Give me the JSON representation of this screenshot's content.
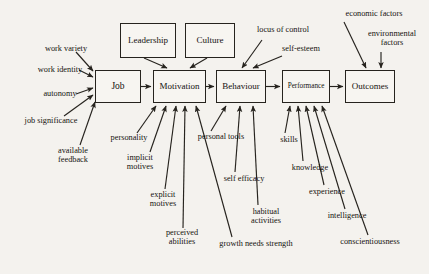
{
  "diagram": {
    "background_color": "#f4f2ee",
    "line_color": "#26231e",
    "boxes": [
      {
        "id": "leadership",
        "label": "Leadership",
        "x": 120,
        "y": 23,
        "w": 56,
        "h": 35,
        "size": 9
      },
      {
        "id": "culture",
        "label": "Culture",
        "x": 185,
        "y": 23,
        "w": 50,
        "h": 35,
        "size": 9
      },
      {
        "id": "job",
        "label": "Job",
        "x": 95,
        "y": 70,
        "w": 46,
        "h": 33,
        "size": 9.5
      },
      {
        "id": "motivation",
        "label": "Motivation",
        "x": 153,
        "y": 70,
        "w": 53,
        "h": 33,
        "size": 9
      },
      {
        "id": "behaviour",
        "label": "Behaviour",
        "x": 216,
        "y": 70,
        "w": 50,
        "h": 33,
        "size": 9
      },
      {
        "id": "performance",
        "label": "Performance",
        "x": 282,
        "y": 70,
        "w": 48,
        "h": 33,
        "size": 7.2
      },
      {
        "id": "outcomes",
        "label": "Outcomes",
        "x": 345,
        "y": 70,
        "w": 50,
        "h": 33,
        "size": 9
      }
    ],
    "annotations": [
      {
        "id": "work-variety",
        "label": "work variety",
        "x": 29,
        "y": 45,
        "w": 74,
        "size": 8.3
      },
      {
        "id": "work-identity",
        "label": "work identity",
        "x": 22,
        "y": 66,
        "w": 76,
        "size": 8.3
      },
      {
        "id": "autonomy",
        "label": "autonomy",
        "x": 30,
        "y": 90,
        "w": 60,
        "size": 8.3
      },
      {
        "id": "job-significance",
        "label": "job significance",
        "x": 24,
        "y": 117,
        "w": 54,
        "size": 8.3
      },
      {
        "id": "available-feedback",
        "label": "available feedback",
        "x": 45,
        "y": 147,
        "w": 56,
        "size": 8.3
      },
      {
        "id": "personality",
        "label": "personality",
        "x": 98,
        "y": 134,
        "w": 62,
        "size": 8.3
      },
      {
        "id": "implicit-motives",
        "label": "implicit motives",
        "x": 116,
        "y": 154,
        "w": 48,
        "size": 8.3
      },
      {
        "id": "explicit-motives",
        "label": "explicit motives",
        "x": 139,
        "y": 191,
        "w": 48,
        "size": 8.3
      },
      {
        "id": "perceived-abilities",
        "label": "perceived abilities",
        "x": 153,
        "y": 229,
        "w": 58,
        "size": 8.3
      },
      {
        "id": "personal-tools",
        "label": "personal tools",
        "x": 197,
        "y": 133,
        "w": 48,
        "size": 8.3
      },
      {
        "id": "self-efficacy",
        "label": "self efficacy",
        "x": 221,
        "y": 175,
        "w": 46,
        "size": 8.3
      },
      {
        "id": "habitual-activities",
        "label": "habitual activities",
        "x": 241,
        "y": 208,
        "w": 50,
        "size": 8.3
      },
      {
        "id": "growth-needs-strength",
        "label": "growth needs strength",
        "x": 206,
        "y": 240,
        "w": 100,
        "size": 8.3
      },
      {
        "id": "skills",
        "label": "skills",
        "x": 272,
        "y": 136,
        "w": 34,
        "size": 8.3
      },
      {
        "id": "knowledge",
        "label": "knowledge",
        "x": 281,
        "y": 164,
        "w": 58,
        "size": 8.3
      },
      {
        "id": "experience",
        "label": "experience",
        "x": 297,
        "y": 188,
        "w": 60,
        "size": 8.3
      },
      {
        "id": "intelligence",
        "label": "intelligence",
        "x": 317,
        "y": 212,
        "w": 60,
        "size": 8.3
      },
      {
        "id": "conscientiousness",
        "label": "conscientiousness",
        "x": 325,
        "y": 238,
        "w": 90,
        "size": 8.3
      },
      {
        "id": "locus-of-control",
        "label": "locus of control",
        "x": 246,
        "y": 26,
        "w": 74,
        "size": 8.3
      },
      {
        "id": "self-esteem",
        "label": "self-esteem",
        "x": 272,
        "y": 45,
        "w": 58,
        "size": 8.3
      },
      {
        "id": "economic-factors",
        "label": "economic factors",
        "x": 333,
        "y": 10,
        "w": 82,
        "size": 8.3
      },
      {
        "id": "environmental-factors",
        "label": "environmental factors",
        "x": 360,
        "y": 30,
        "w": 64,
        "size": 8.3
      }
    ],
    "flow_arrows": [
      {
        "from": "job",
        "to": "motivation"
      },
      {
        "from": "motivation",
        "to": "behaviour"
      },
      {
        "from": "behaviour",
        "to": "performance"
      },
      {
        "from": "performance",
        "to": "outcomes"
      }
    ],
    "influence_arrows": [
      {
        "from": "leadership",
        "to": "motivation"
      },
      {
        "from": "culture",
        "to": "motivation"
      },
      {
        "from": "work-variety",
        "to": "job"
      },
      {
        "from": "work-identity",
        "to": "job"
      },
      {
        "from": "autonomy",
        "to": "job"
      },
      {
        "from": "job-significance",
        "to": "job"
      },
      {
        "from": "available-feedback",
        "to": "job"
      },
      {
        "from": "personality",
        "to": "motivation"
      },
      {
        "from": "implicit-motives",
        "to": "motivation"
      },
      {
        "from": "explicit-motives",
        "to": "motivation"
      },
      {
        "from": "perceived-abilities",
        "to": "motivation"
      },
      {
        "from": "growth-needs-strength",
        "to": "motivation"
      },
      {
        "from": "personal-tools",
        "to": "behaviour"
      },
      {
        "from": "self-efficacy",
        "to": "behaviour"
      },
      {
        "from": "habitual-activities",
        "to": "behaviour"
      },
      {
        "from": "skills",
        "to": "performance"
      },
      {
        "from": "knowledge",
        "to": "performance"
      },
      {
        "from": "experience",
        "to": "performance"
      },
      {
        "from": "intelligence",
        "to": "performance"
      },
      {
        "from": "conscientiousness",
        "to": "performance"
      },
      {
        "from": "locus-of-control",
        "to": "behaviour"
      },
      {
        "from": "self-esteem",
        "to": "behaviour"
      },
      {
        "from": "economic-factors",
        "to": "outcomes"
      },
      {
        "from": "environmental-factors",
        "to": "outcomes"
      }
    ]
  }
}
